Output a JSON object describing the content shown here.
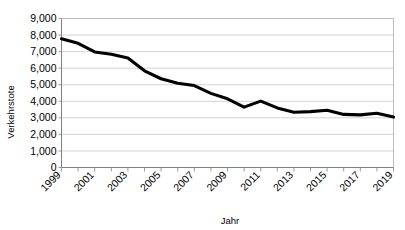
{
  "chart_data": {
    "type": "line",
    "title": "",
    "xlabel": "Jahr",
    "ylabel": "Verkehrstote",
    "grid": true,
    "legend": false,
    "ylim": [
      0,
      9000
    ],
    "ytick_step": 1000,
    "ytick_labels": [
      "9,000",
      "8,000",
      "7,000",
      "6,000",
      "5,000",
      "4,000",
      "3,000",
      "2,000",
      "1,000",
      "0"
    ],
    "ytick_values": [
      9000,
      8000,
      7000,
      6000,
      5000,
      4000,
      3000,
      2000,
      1000,
      0
    ],
    "x": [
      1999,
      2000,
      2001,
      2002,
      2003,
      2004,
      2005,
      2006,
      2007,
      2008,
      2009,
      2010,
      2011,
      2012,
      2013,
      2014,
      2015,
      2016,
      2017,
      2018,
      2019
    ],
    "xtick_labels": [
      "1999",
      "2001",
      "2003",
      "2005",
      "2007",
      "2009",
      "2011",
      "2013",
      "2015",
      "2017",
      "2019"
    ],
    "xtick_label_values": [
      1999,
      2001,
      2003,
      2005,
      2007,
      2009,
      2011,
      2013,
      2015,
      2017,
      2019
    ],
    "xlim": [
      1999,
      2019
    ],
    "series": [
      {
        "name": "Verkehrstote",
        "color": "#000000",
        "values": [
          7772,
          7503,
          6977,
          6842,
          6613,
          5842,
          5361,
          5091,
          4949,
          4477,
          4152,
          3648,
          4009,
          3600,
          3339,
          3377,
          3459,
          3206,
          3180,
          3275,
          3046
        ]
      }
    ]
  },
  "axes": {
    "ylabel": "Verkehrstote",
    "xlabel": "Jahr"
  }
}
